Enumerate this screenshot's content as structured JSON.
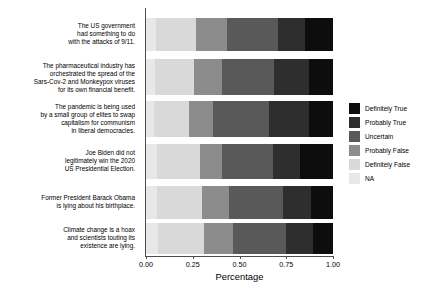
{
  "chart_data": {
    "type": "bar",
    "subtype": "stacked-horizontal-100pct",
    "title": "",
    "xlabel": "Percentage",
    "ylabel": "",
    "xlim": [
      0.0,
      1.0
    ],
    "xticks": [
      "0.00",
      "0.25",
      "0.50",
      "0.75",
      "1.00"
    ],
    "xtick_values": [
      0.0,
      0.25,
      0.5,
      0.75,
      1.0
    ],
    "grid": false,
    "legend_position": "right",
    "orientation": "horizontal",
    "stack_order_left_to_right": [
      "NA",
      "Definitely False",
      "Probably False",
      "Uncertain",
      "Probably True",
      "Definitely True"
    ],
    "categories": [
      "The US government\nhad something to do\nwith the attacks of 9/11.",
      "The pharmaceutical industry has\norchestrated the spread of the\nSars-Cov-2 and Monkeypox viruses\nfor its own financial benefit.",
      "The pandemic is being used\nby a small group of elites to swap\ncapitalism for communism\nin liberal democracies.",
      "Joe Biden did not\nlegitimately win the 2020\nUS Presidential Election.",
      "Former President Barack Obama\nis lying about his birthplace.",
      "Climate change is a hoax\nand scientists touting its\nexistence are lying."
    ],
    "series": [
      {
        "name": "NA",
        "color": "#e8e8e8",
        "values": [
          0.055,
          0.05,
          0.045,
          0.06,
          0.06,
          0.065
        ]
      },
      {
        "name": "Definitely False",
        "color": "#d9d9d9",
        "values": [
          0.212,
          0.207,
          0.185,
          0.229,
          0.24,
          0.245
        ]
      },
      {
        "name": "Probably False",
        "color": "#8c8c8c",
        "values": [
          0.166,
          0.15,
          0.128,
          0.118,
          0.144,
          0.155
        ]
      },
      {
        "name": "Uncertain",
        "color": "#595959",
        "values": [
          0.273,
          0.278,
          0.299,
          0.273,
          0.289,
          0.283
        ]
      },
      {
        "name": "Probably True",
        "color": "#2e2e2e",
        "values": [
          0.144,
          0.187,
          0.214,
          0.144,
          0.15,
          0.144
        ]
      },
      {
        "name": "Definitely True",
        "color": "#0d0d0d",
        "values": [
          0.15,
          0.128,
          0.129,
          0.176,
          0.117,
          0.107
        ]
      }
    ],
    "legend_entries": [
      {
        "label": "Definitely True",
        "color": "#0d0d0d"
      },
      {
        "label": "Probably True",
        "color": "#2e2e2e"
      },
      {
        "label": "Uncertain",
        "color": "#595959"
      },
      {
        "label": "Probably False",
        "color": "#8c8c8c"
      },
      {
        "label": "Definitely False",
        "color": "#d9d9d9"
      },
      {
        "label": "NA",
        "color": "#e8e8e8"
      }
    ]
  }
}
